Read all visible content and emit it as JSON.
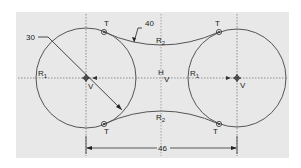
{
  "drawing": {
    "background_color": "#e8e8e8",
    "line_color": "#555555",
    "dimension_color": "#222222",
    "dimensions": {
      "radius": "30",
      "arc_radius": "40",
      "center_distance": "46"
    },
    "labels": {
      "circle_radius_left": {
        "main": "R",
        "sub": "1"
      },
      "circle_radius_right": {
        "main": "R",
        "sub": "1"
      },
      "arc_top": {
        "main": "R",
        "sub": "2"
      },
      "arc_bottom": {
        "main": "R",
        "sub": "2"
      },
      "tangent": "T",
      "vertical_constraint": "V",
      "horizontal_constraint": "H"
    }
  }
}
